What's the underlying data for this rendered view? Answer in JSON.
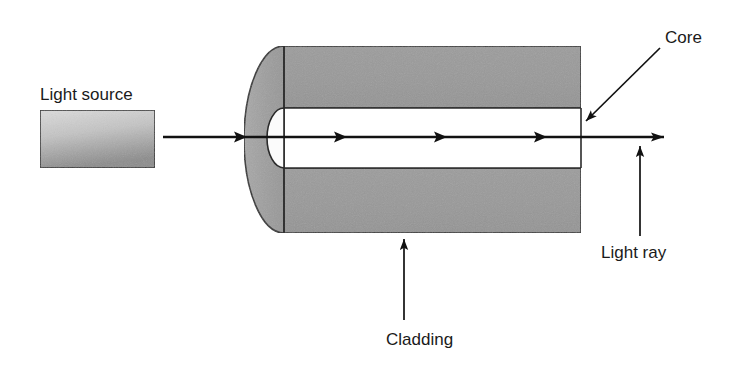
{
  "figure": {
    "type": "diagram",
    "background_color": "#ffffff",
    "line_color": "#1a1a1a",
    "cladding_fill": "#9a9a9a",
    "cladding_face_fill": "#a6a6a6",
    "core_fill": "#ffffff",
    "source_fill_light": "#d5d5d5",
    "source_fill_dark": "#8f8f8f"
  },
  "labels": {
    "light_source": "Light source",
    "core": "Core",
    "cladding": "Cladding",
    "light_ray": "Light ray"
  },
  "parts": {
    "light_source_box": {
      "name": "Light source",
      "x": 40,
      "y": 110,
      "width": 115,
      "height": 58
    },
    "cladding_body": {
      "name": "Cladding",
      "x": 284,
      "y": 46,
      "width": 297,
      "height": 187
    },
    "cladding_end_cap": {
      "name": "Cladding end face",
      "cx": 284,
      "cy": 139.5,
      "rx": 40,
      "ry": 93.5
    },
    "core_channel": {
      "name": "Core",
      "x": 284,
      "y": 108,
      "width": 297,
      "height": 60
    },
    "core_end_cap": {
      "name": "Core end face",
      "cx": 284,
      "cy": 138,
      "rx": 17,
      "ry": 30
    }
  },
  "light_ray": {
    "name": "Light ray",
    "y": 137,
    "x_start": 163,
    "x_end": 665,
    "arrow_positions": [
      247,
      347,
      447,
      547,
      665
    ]
  },
  "leader_lines": {
    "core": {
      "label_x": 665,
      "label_y": 43,
      "from_x": 660,
      "from_y": 48,
      "to_x": 585,
      "to_y": 122
    },
    "cladding": {
      "label_x": 390,
      "label_y": 344,
      "from_x": 404,
      "from_y": 320,
      "to_x": 404,
      "to_y": 238
    },
    "light_ray": {
      "label_x": 601,
      "label_y": 257,
      "from_x": 640,
      "from_y": 235,
      "to_x": 640,
      "to_y": 145
    }
  }
}
